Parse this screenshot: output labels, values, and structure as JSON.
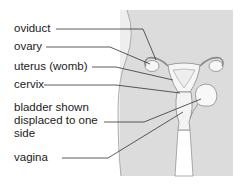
{
  "diagram": {
    "type": "anatomical",
    "colors": {
      "panel": "#dcdcdc",
      "body_outer": "#ececec",
      "organ_fill": "#f6f6f6",
      "outline": "#8a8a8a",
      "leader_line": "#333333",
      "text": "#222222"
    },
    "labels": [
      {
        "id": "oviduct",
        "text": "oviduct"
      },
      {
        "id": "ovary",
        "text": "ovary"
      },
      {
        "id": "uterus",
        "text": "uterus (womb)"
      },
      {
        "id": "cervix",
        "text": "cervix"
      },
      {
        "id": "bladder",
        "text": "bladder shown displaced to one side"
      },
      {
        "id": "vagina",
        "text": "vagina"
      }
    ]
  }
}
